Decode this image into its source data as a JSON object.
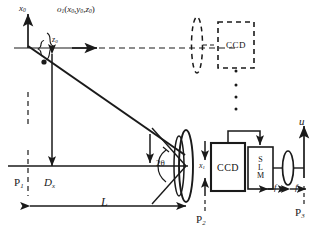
{
  "figure": {
    "type": "optical-setup-diagram",
    "line_color": "#1a1a1a",
    "background": "#ffffff"
  },
  "labels": {
    "x0_axis": "x",
    "x0_axis_sub": "0",
    "z0_axis": "z",
    "z0_axis_sub": "0",
    "object_point": "o",
    "object_point_sub": "1",
    "object_point_coords": "(x",
    "object_coord_full": "o₁(x₀,y₀,z₀)",
    "coord_x": "x",
    "coord_x_sub": "0",
    "coord_y": "y",
    "coord_y_sub": "0",
    "coord_z": "z",
    "coord_z_sub": "0",
    "plane_1": "P",
    "plane_1_sub": "1",
    "plane_2": "P",
    "plane_2_sub": "2",
    "plane_3": "P",
    "plane_3_sub": "3",
    "offset_dx": "D",
    "offset_dx_sub": "x",
    "distance_L": "L",
    "angle_2theta": "2θ",
    "image_x1": "x",
    "image_x1_sub": "1",
    "u_axis": "u",
    "focal_1": "f",
    "focal_2": "f"
  },
  "components": {
    "ccd_main": "CCD",
    "ccd_ghost": "CCD",
    "slm_lines": [
      "S",
      "L",
      "M"
    ],
    "lens_object": "lens",
    "lens_fourier": "lens"
  },
  "annotations": {
    "ellipsis_dots": 3,
    "ghost_note": "dashed CCD indicates alternate recording position"
  }
}
